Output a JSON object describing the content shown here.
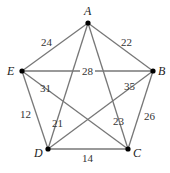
{
  "graph": {
    "vertices": [
      {
        "id": "A",
        "label": "A",
        "x": 88,
        "y": 23,
        "lx": 84,
        "ly": 15
      },
      {
        "id": "B",
        "label": "B",
        "x": 153,
        "y": 71,
        "lx": 158,
        "ly": 75
      },
      {
        "id": "C",
        "label": "C",
        "x": 128,
        "y": 149,
        "lx": 133,
        "ly": 157
      },
      {
        "id": "D",
        "label": "D",
        "x": 48,
        "y": 149,
        "lx": 34,
        "ly": 157
      },
      {
        "id": "E",
        "label": "E",
        "x": 22,
        "y": 71,
        "lx": 7,
        "ly": 75
      }
    ],
    "edges": [
      {
        "from": "A",
        "to": "E",
        "weight": "24",
        "lx": 41,
        "ly": 46
      },
      {
        "from": "A",
        "to": "B",
        "weight": "22",
        "lx": 121,
        "ly": 46
      },
      {
        "from": "E",
        "to": "B",
        "weight": "28",
        "lx": 82,
        "ly": 75
      },
      {
        "from": "E",
        "to": "C",
        "weight": "31",
        "lx": 40,
        "ly": 92
      },
      {
        "from": "B",
        "to": "D",
        "weight": "35",
        "lx": 124,
        "ly": 90
      },
      {
        "from": "E",
        "to": "D",
        "weight": "12",
        "lx": 20,
        "ly": 118
      },
      {
        "from": "A",
        "to": "D",
        "weight": "21",
        "lx": 52,
        "ly": 127
      },
      {
        "from": "A",
        "to": "C",
        "weight": "23",
        "lx": 113,
        "ly": 125
      },
      {
        "from": "B",
        "to": "C",
        "weight": "26",
        "lx": 144,
        "ly": 120
      },
      {
        "from": "D",
        "to": "C",
        "weight": "14",
        "lx": 82,
        "ly": 162
      }
    ]
  }
}
